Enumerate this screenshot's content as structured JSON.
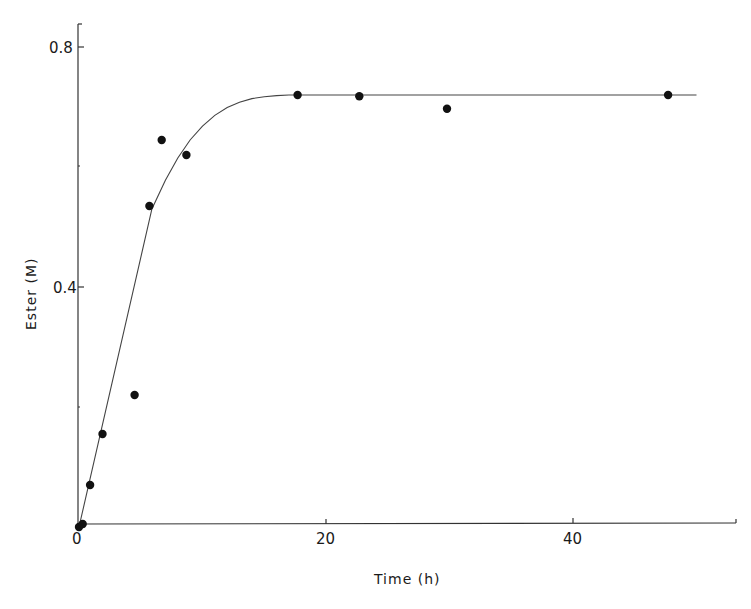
{
  "chart_data": {
    "type": "scatter",
    "title": "",
    "xlabel": "Time (h)",
    "ylabel": "Ester (M)",
    "xlim": [
      0,
      53
    ],
    "ylim": [
      0,
      0.84
    ],
    "xticks": [
      0,
      20,
      40
    ],
    "xtick_labels": [
      "0",
      "20",
      "40"
    ],
    "yticks": [
      0.4,
      0.8
    ],
    "ytick_labels": [
      "0.4",
      "0.8"
    ],
    "grid": false,
    "legend": null,
    "series": [
      {
        "name": "measured",
        "kind": "scatter",
        "x": [
          0,
          0.3,
          0.9,
          1.9,
          4.5,
          5.7,
          6.7,
          8.7,
          17.7,
          22.7,
          29.8,
          47.7
        ],
        "y": [
          0.0,
          0.005,
          0.07,
          0.155,
          0.22,
          0.535,
          0.645,
          0.62,
          0.72,
          0.718,
          0.697,
          0.72
        ]
      },
      {
        "name": "fit",
        "kind": "line",
        "x": [
          0,
          5.9,
          7,
          8,
          9,
          10,
          11,
          12,
          13,
          14,
          15,
          16,
          17,
          18,
          20,
          25,
          30,
          40,
          50
        ],
        "y": [
          0,
          0.53,
          0.578,
          0.615,
          0.645,
          0.668,
          0.686,
          0.699,
          0.708,
          0.714,
          0.717,
          0.719,
          0.72,
          0.72,
          0.72,
          0.72,
          0.72,
          0.72,
          0.72
        ]
      }
    ]
  },
  "axes": {
    "origin_label": "0",
    "x_tick_20": "20",
    "x_tick_40": "40",
    "y_tick_04": "0.4",
    "y_tick_08": "0.8",
    "xlabel": "Time (h)",
    "ylabel": "Ester (M)"
  }
}
